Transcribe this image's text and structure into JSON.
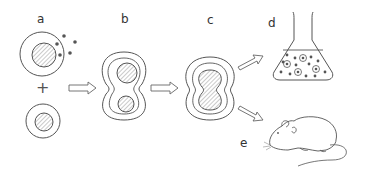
{
  "diagram": {
    "labels": {
      "a": "a",
      "b": "b",
      "c": "c",
      "d": "d",
      "e": "e",
      "plus": "+"
    },
    "stages": [
      {
        "id": "a",
        "description": "Two separate cells: one antibody-secreting cell (with dots) and one myeloma cell"
      },
      {
        "id": "b",
        "description": "Cells fusing, two nuclei within a single membrane"
      },
      {
        "id": "c",
        "description": "Fused hybrid cell with merging nuclei"
      },
      {
        "id": "d",
        "description": "Flask of culture medium with hybrid cells and antibodies"
      },
      {
        "id": "e",
        "description": "Mouse"
      }
    ],
    "colors": {
      "stroke": "#555555",
      "hatch": "#888888",
      "text": "#333333",
      "background": "#ffffff"
    }
  }
}
